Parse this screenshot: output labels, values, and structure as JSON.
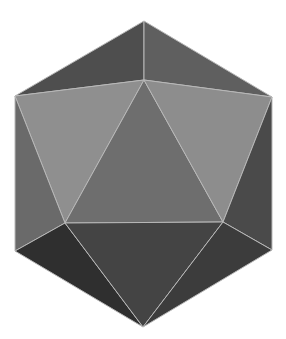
{
  "figure": {
    "subject": "icosahedron",
    "background": "#ffffff",
    "edge_color": "#b8b8b8",
    "vertices": {
      "T": [
        144,
        21
      ],
      "C": [
        144,
        80
      ],
      "UL": [
        15,
        96
      ],
      "UR": [
        272,
        97
      ],
      "ML": [
        65,
        223
      ],
      "MR": [
        223,
        222
      ],
      "LL": [
        15,
        251
      ],
      "LR": [
        272,
        250
      ],
      "B": [
        143,
        327
      ]
    },
    "faces": [
      {
        "name": "top-left-face",
        "points": [
          "T",
          "UL",
          "C"
        ],
        "color": "#4e4e4e"
      },
      {
        "name": "top-right-face",
        "points": [
          "T",
          "C",
          "UR"
        ],
        "color": "#5f5f5f"
      },
      {
        "name": "upper-left-face",
        "points": [
          "UL",
          "C",
          "ML"
        ],
        "color": "#8f8f8f"
      },
      {
        "name": "center-face",
        "points": [
          "C",
          "ML",
          "MR"
        ],
        "color": "#6e6e6e"
      },
      {
        "name": "upper-right-face",
        "points": [
          "C",
          "UR",
          "MR"
        ],
        "color": "#8d8d8d"
      },
      {
        "name": "left-side-face",
        "points": [
          "UL",
          "ML",
          "LL"
        ],
        "color": "#6a6a6a"
      },
      {
        "name": "right-side-face",
        "points": [
          "UR",
          "MR",
          "LR"
        ],
        "color": "#4a4a4a"
      },
      {
        "name": "bottom-left-face",
        "points": [
          "LL",
          "ML",
          "B"
        ],
        "color": "#2f2f2f"
      },
      {
        "name": "bottom-center-face",
        "points": [
          "ML",
          "MR",
          "B"
        ],
        "color": "#444444"
      },
      {
        "name": "bottom-right-face",
        "points": [
          "MR",
          "LR",
          "B"
        ],
        "color": "#3c3c3c"
      }
    ]
  }
}
